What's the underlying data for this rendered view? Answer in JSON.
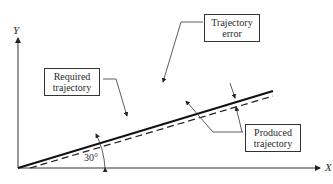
{
  "diagram": {
    "axes": {
      "x_label": "X",
      "y_label": "Y"
    },
    "angle_label": "30°",
    "labels": {
      "required": [
        "Required",
        "trajectory"
      ],
      "error": [
        "Trajectory",
        "error"
      ],
      "produced": [
        "Produced",
        "trajectory"
      ]
    },
    "lines": [
      {
        "name": "Required trajectory",
        "style": "solid"
      },
      {
        "name": "Produced trajectory",
        "style": "dashed"
      }
    ]
  }
}
